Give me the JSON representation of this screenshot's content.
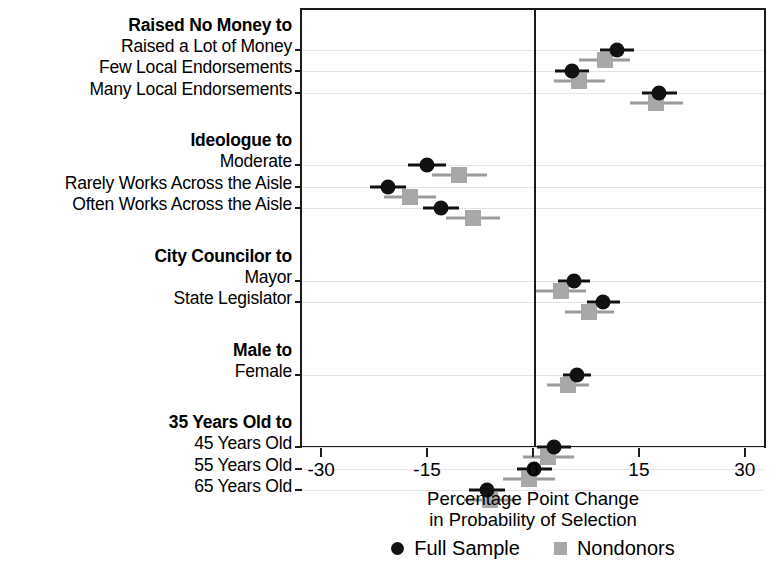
{
  "chart_data": {
    "type": "scatter",
    "title": "",
    "xlabel": "Percentage Point Change in Probability of Selection",
    "xlabel_line1": "Percentage Point Change",
    "xlabel_line2": "in Probability of Selection",
    "ylabel": "",
    "xlim": [
      -33,
      33
    ],
    "xticks": [
      -30,
      -15,
      0,
      15,
      30
    ],
    "xticklabels": [
      "-30",
      "-15",
      "0",
      "15",
      "30"
    ],
    "grid": true,
    "zero_reference_line": 0,
    "legend_position": "bottom-center",
    "legend": [
      {
        "name": "Full Sample",
        "marker": "circle",
        "color": "#111111"
      },
      {
        "name": "Nondonors",
        "marker": "square",
        "color": "#a8a8a8"
      }
    ],
    "groups": [
      {
        "header": "Raised No Money to",
        "rows": [
          {
            "label": "Raised a Lot of Money",
            "full_sample": {
              "estimate": 11.6,
              "ci_low": 9.2,
              "ci_high": 14.0
            },
            "nondonors": {
              "estimate": 9.9,
              "ci_low": 6.2,
              "ci_high": 13.5
            }
          },
          {
            "label": "Few Local Endorsements",
            "full_sample": {
              "estimate": 5.2,
              "ci_low": 2.8,
              "ci_high": 7.6
            },
            "nondonors": {
              "estimate": 6.3,
              "ci_low": 2.7,
              "ci_high": 9.9
            }
          },
          {
            "label": "Many Local Endorsements",
            "full_sample": {
              "estimate": 17.6,
              "ci_low": 15.1,
              "ci_high": 20.1
            },
            "nondonors": {
              "estimate": 17.2,
              "ci_low": 13.5,
              "ci_high": 20.9
            }
          }
        ]
      },
      {
        "header": "Ideologue to",
        "rows": [
          {
            "label": "Moderate",
            "full_sample": {
              "estimate": -15.3,
              "ci_low": -18.0,
              "ci_high": -12.6
            },
            "nondonors": {
              "estimate": -10.7,
              "ci_low": -14.6,
              "ci_high": -6.8
            }
          },
          {
            "label": "Rarely Works Across the Aisle",
            "full_sample": {
              "estimate": -20.8,
              "ci_low": -23.3,
              "ci_high": -18.3
            },
            "nondonors": {
              "estimate": -17.7,
              "ci_low": -21.4,
              "ci_high": -14.0
            }
          },
          {
            "label": "Often Works Across the Aisle",
            "full_sample": {
              "estimate": -13.3,
              "ci_low": -15.9,
              "ci_high": -10.7
            },
            "nondonors": {
              "estimate": -8.8,
              "ci_low": -12.6,
              "ci_high": -5.0
            }
          }
        ]
      },
      {
        "header": "City Councilor to",
        "rows": [
          {
            "label": "Mayor",
            "full_sample": {
              "estimate": 5.5,
              "ci_low": 3.2,
              "ci_high": 7.8
            },
            "nondonors": {
              "estimate": 3.7,
              "ci_low": 0.2,
              "ci_high": 7.2
            }
          },
          {
            "label": "State Legislator",
            "full_sample": {
              "estimate": 9.7,
              "ci_low": 7.4,
              "ci_high": 12.0
            },
            "nondonors": {
              "estimate": 7.7,
              "ci_low": 4.2,
              "ci_high": 11.2
            }
          }
        ]
      },
      {
        "header": "Male to",
        "rows": [
          {
            "label": "Female",
            "full_sample": {
              "estimate": 5.9,
              "ci_low": 3.9,
              "ci_high": 7.9
            },
            "nondonors": {
              "estimate": 4.7,
              "ci_low": 1.7,
              "ci_high": 7.7
            }
          }
        ]
      },
      {
        "header": "35 Years Old to",
        "rows": [
          {
            "label": "45 Years Old",
            "full_sample": {
              "estimate": 2.7,
              "ci_low": 0.3,
              "ci_high": 5.1
            },
            "nondonors": {
              "estimate": 1.9,
              "ci_low": -1.7,
              "ci_high": 5.5
            }
          },
          {
            "label": "55 Years Old",
            "full_sample": {
              "estimate": -0.1,
              "ci_low": -2.6,
              "ci_high": 2.4
            },
            "nondonors": {
              "estimate": -0.8,
              "ci_low": -4.5,
              "ci_high": 2.9
            }
          },
          {
            "label": "65 Years Old",
            "full_sample": {
              "estimate": -6.8,
              "ci_low": -9.3,
              "ci_high": -4.3
            },
            "nondonors": {
              "estimate": -6.4,
              "ci_low": -10.1,
              "ci_high": -2.7
            }
          }
        ]
      }
    ]
  }
}
